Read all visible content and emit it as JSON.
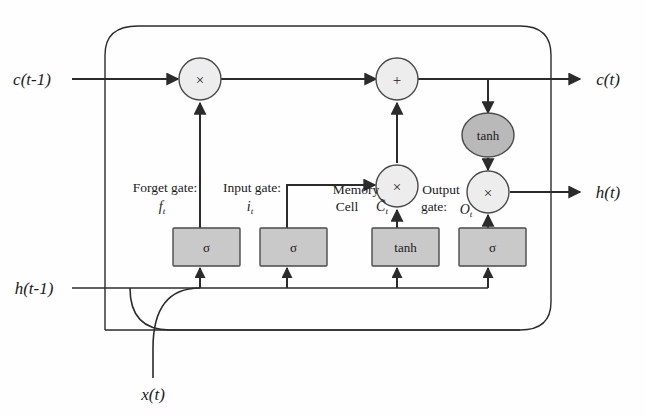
{
  "diagram": {
    "colors": {
      "line": "#2b2b2b",
      "box_fill": "#c9c9c9",
      "box_stroke": "#4a4a4a",
      "circle_fill": "#ededed",
      "tanh_ellipse_fill": "#b9b9b9",
      "text": "#1a1a1a",
      "background": "#ffffff"
    },
    "io": {
      "c_prev": "c(t-1)",
      "h_prev": "h(t-1)",
      "x_input": "x(t)",
      "c_out": "c(t)",
      "h_out": "h(t)"
    },
    "gates": [
      {
        "id": "forget",
        "caption_line1": "Forget gate:",
        "symbol": "f",
        "symbol_sub": "t",
        "activation": "σ"
      },
      {
        "id": "input",
        "caption_line1": "Input gate:",
        "symbol": "i",
        "symbol_sub": "t",
        "activation": "σ"
      },
      {
        "id": "memory-cell",
        "caption_line1": "Memory",
        "caption_line2": "Cell",
        "symbol": "C̃",
        "symbol_sub": "t",
        "activation": "tanh"
      },
      {
        "id": "output",
        "caption_line1": "Output",
        "caption_line2": "gate:",
        "symbol": "O",
        "symbol_sub": "t",
        "activation": "σ"
      }
    ],
    "operators": [
      {
        "id": "forget-multiply",
        "glyph": "×"
      },
      {
        "id": "cell-add",
        "glyph": "+"
      },
      {
        "id": "input-multiply",
        "glyph": "×"
      },
      {
        "id": "output-multiply",
        "glyph": "×"
      }
    ],
    "activation_node": {
      "id": "cell-tanh",
      "label": "tanh"
    }
  }
}
